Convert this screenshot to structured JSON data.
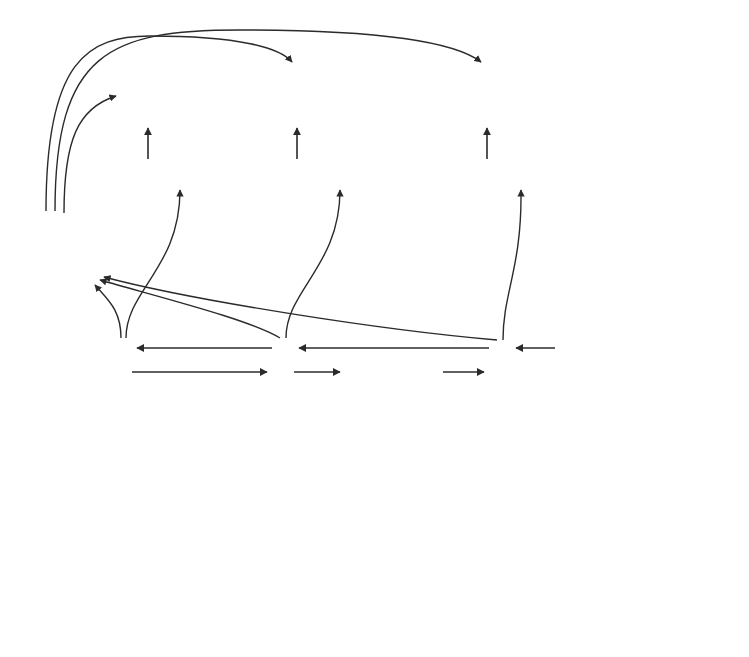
{
  "figure": {
    "background": "#ffffff"
  },
  "colors": {
    "stroke": "#2b2b2b",
    "box_light": "#d2d2d2",
    "box_light_border": "#b4b4b4",
    "diamond_fill": "#d4d4d4",
    "diamond_border": "#b0b0b0",
    "doc_fill": "#c9c9c9",
    "doc_border": "#aeaeae",
    "feat_ss": "#6e6e6e",
    "feat_ws": "#9a9a9a",
    "feat_sl": "#d8d8d8",
    "text": "#1a1a1a"
  },
  "layer_labels": [
    {
      "id": "classification",
      "text": "Classification Layer",
      "x": 586,
      "y": 86
    },
    {
      "id": "feature",
      "text": "Feature Layer",
      "x": 600,
      "y": 166
    },
    {
      "id": "rnn-sentence",
      "text": "RNN Hidden State\nSentence Layer",
      "x": 586,
      "y": 343
    },
    {
      "id": "rnn-word",
      "text": "RNN Hidden State\nWord Layer",
      "x": 586,
      "y": 452
    },
    {
      "id": "word-embeddings",
      "text": "Word Embeddings\nLayer",
      "x": 586,
      "y": 540
    }
  ],
  "classification": {
    "nodes": [
      {
        "id": "cls-1",
        "label": "0",
        "cx": 148,
        "cy": 94
      },
      {
        "id": "cls-2",
        "label": "1",
        "cx": 297,
        "cy": 94
      },
      {
        "id": "cls-3",
        "label": "0",
        "cx": 487,
        "cy": 94
      }
    ],
    "half_w": 30,
    "half_h": 30
  },
  "feature_layer": {
    "segment_labels": [
      "SS",
      "WS",
      "SL"
    ],
    "boxes": [
      {
        "id": "feat-1",
        "x": 93,
        "y": 160,
        "w": 92,
        "h": 25
      },
      {
        "id": "feat-2",
        "x": 253,
        "y": 160,
        "w": 92,
        "h": 25
      },
      {
        "id": "feat-3",
        "x": 433,
        "y": 160,
        "w": 92,
        "h": 25
      }
    ]
  },
  "doc_representation": {
    "id": "doc-rep",
    "line1": "Doc",
    "line2": "Representation",
    "x": 35,
    "y": 211,
    "w": 117,
    "h": 58
  },
  "sentence_layer": {
    "nodes": [
      {
        "id": "sent-1",
        "x": 110,
        "y": 338,
        "w": 22,
        "h": 46
      },
      {
        "id": "sent-2",
        "x": 272,
        "y": 338,
        "w": 22,
        "h": 46
      },
      {
        "id": "sent-3",
        "x": 489,
        "y": 338,
        "w": 22,
        "h": 46
      }
    ],
    "ellipsis": {
      "text": "...",
      "x": 383,
      "y": 353
    }
  },
  "word_layer": {
    "groups": [
      {
        "id": "wgrp-1",
        "boxes": [
          {
            "x": 61,
            "y": 450
          },
          {
            "x": 97,
            "y": 450
          },
          {
            "x": 159,
            "y": 450
          }
        ],
        "ellipsis": {
          "text": "...",
          "x": 133,
          "y": 472
        }
      },
      {
        "id": "wgrp-2",
        "boxes": [
          {
            "x": 222,
            "y": 450
          },
          {
            "x": 258,
            "y": 450
          },
          {
            "x": 320,
            "y": 450
          }
        ],
        "ellipsis": {
          "text": "...",
          "x": 294,
          "y": 472
        }
      },
      {
        "id": "wgrp-3",
        "boxes": [
          {
            "x": 439,
            "y": 450
          },
          {
            "x": 475,
            "y": 450
          },
          {
            "x": 537,
            "y": 450
          }
        ],
        "ellipsis": {
          "text": "...",
          "x": 511,
          "y": 472
        }
      }
    ],
    "box_w": 22,
    "box_h": 40,
    "group_ellipsis": {
      "text": "...",
      "x": 383,
      "y": 470
    }
  },
  "embedding_layer": {
    "groups": [
      {
        "id": "egrp-1",
        "boxes": [
          {
            "x": 62,
            "y": 536
          },
          {
            "x": 98,
            "y": 536
          },
          {
            "x": 160,
            "y": 536
          }
        ],
        "ellipsis": {
          "text": "...",
          "x": 132,
          "y": 556
        }
      },
      {
        "id": "egrp-2",
        "boxes": [
          {
            "x": 223,
            "y": 536
          },
          {
            "x": 259,
            "y": 536
          },
          {
            "x": 321,
            "y": 536
          }
        ],
        "ellipsis": {
          "text": "...",
          "x": 293,
          "y": 556
        }
      },
      {
        "id": "egrp-3",
        "boxes": [
          {
            "x": 440,
            "y": 536
          },
          {
            "x": 476,
            "y": 536
          },
          {
            "x": 538,
            "y": 536
          }
        ],
        "ellipsis": {
          "text": "...",
          "x": 510,
          "y": 556
        }
      }
    ],
    "box_w": 21,
    "box_h": 40,
    "group_ellipsis": {
      "text": "...",
      "x": 383,
      "y": 556
    }
  },
  "input_words": {
    "sentences": [
      {
        "id": "sent-words-1",
        "tokens": [
          {
            "text": "He",
            "x": 72,
            "y": 618
          },
          {
            "text": "likes ... much",
            "x": 144,
            "y": 618
          }
        ]
      },
      {
        "id": "sent-words-2",
        "tokens": [
          {
            "text": "The",
            "x": 234,
            "y": 618
          },
          {
            "text": "beach... beautiful",
            "x": 318,
            "y": 618
          }
        ]
      },
      {
        "id": "sent-words-3",
        "tokens": [
          {
            "text": "Where do ...",
            "x": 466,
            "y": 618
          },
          {
            "text": "go?",
            "x": 548,
            "y": 618
          }
        ]
      }
    ]
  }
}
